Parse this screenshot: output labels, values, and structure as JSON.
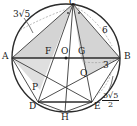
{
  "figure": {
    "type": "circle-geometry-diagram",
    "canvas": {
      "width": 137,
      "height": 126
    },
    "colors": {
      "stroke": "#2b2b2b",
      "thin_stroke": "#555555",
      "fill_gray": "#c9c9c9",
      "dashed": "#9a9a9a",
      "text": "#1a1a1a",
      "background": "#ffffff"
    },
    "circle": {
      "cx": 66,
      "cy": 58,
      "r": 54
    },
    "center_point": {
      "label": "O",
      "x": 66,
      "y": 58
    },
    "points": [
      {
        "name": "A",
        "x": 12,
        "y": 58,
        "label": "A",
        "label_x": 2,
        "label_y": 53
      },
      {
        "name": "B",
        "x": 120,
        "y": 58,
        "label": "B",
        "label_x": 124,
        "label_y": 53
      },
      {
        "name": "C",
        "x": 73,
        "y": 4,
        "label": "C",
        "label_x": 69,
        "label_y": -4
      },
      {
        "name": "D",
        "x": 38,
        "y": 102,
        "label": "D",
        "label_x": 30,
        "label_y": 103
      },
      {
        "name": "E",
        "x": 92,
        "y": 102,
        "label": "E",
        "label_x": 95,
        "label_y": 103
      },
      {
        "name": "F",
        "x": 52,
        "y": 58,
        "label": "F",
        "label_x": 46,
        "label_y": 48
      },
      {
        "name": "G",
        "x": 81,
        "y": 58,
        "label": "G",
        "label_x": 79,
        "label_y": 48
      },
      {
        "name": "H",
        "x": 65,
        "y": 112,
        "label": "H",
        "label_x": 61,
        "label_y": 113
      },
      {
        "name": "O",
        "x": 66,
        "y": 58,
        "label": "O",
        "label_x": 62,
        "label_y": 48
      },
      {
        "name": "P",
        "x": 40,
        "y": 90,
        "label": "P",
        "label_x": 32,
        "label_y": 84
      },
      {
        "name": "Q",
        "x": 88,
        "y": 76,
        "label": "Q",
        "label_x": 81,
        "label_y": 70
      }
    ],
    "measurements": [
      {
        "id": "ac-length",
        "text": "3√5",
        "parts": {
          "coef": "3",
          "radicand": "5"
        },
        "x": 14,
        "y": 11,
        "kind": "radical"
      },
      {
        "id": "cb-length",
        "text": "6",
        "parts": {
          "coef": "6"
        },
        "x": 103,
        "y": 28,
        "kind": "plain"
      },
      {
        "id": "gb-length",
        "text": "3",
        "parts": {
          "coef": "3"
        },
        "x": 104,
        "y": 63,
        "kind": "plain"
      },
      {
        "id": "be-length",
        "text": "3√5/2",
        "parts": {
          "num_coef": "3",
          "num_rad": "5",
          "den": "2"
        },
        "x": 104,
        "y": 94,
        "kind": "fraction-radical"
      }
    ],
    "angle_marks": [
      {
        "id": "angle-mark-left",
        "x": 68,
        "y": 12
      },
      {
        "id": "angle-mark-right",
        "x": 79,
        "y": 12
      }
    ],
    "shaded_regions": [
      {
        "id": "triangle-a-c-f",
        "vertices": [
          "A",
          "C",
          "F"
        ]
      },
      {
        "id": "triangle-c-g-b",
        "vertices": [
          "C",
          "G",
          "B"
        ]
      },
      {
        "id": "triangle-g-q-b",
        "vertices": [
          "G",
          "Q",
          "B"
        ]
      },
      {
        "id": "triangle-a-f-p",
        "vertices": [
          "A",
          "F",
          "P"
        ]
      }
    ],
    "segments": [
      {
        "id": "chord-ab",
        "from": "A",
        "to": "B",
        "style": "solid-thick"
      },
      {
        "id": "chord-de",
        "from": "D",
        "to": "E",
        "style": "solid-thick"
      },
      {
        "id": "chord-ac",
        "from": "A",
        "to": "C",
        "style": "solid"
      },
      {
        "id": "chord-cb",
        "from": "C",
        "to": "B",
        "style": "solid"
      },
      {
        "id": "chord-ch",
        "from": "C",
        "to": "H",
        "style": "solid"
      },
      {
        "id": "chord-cd",
        "from": "C",
        "to": "D",
        "style": "solid"
      },
      {
        "id": "chord-ce",
        "from": "C",
        "to": "E",
        "style": "solid"
      },
      {
        "id": "chord-ad",
        "from": "A",
        "to": "D",
        "style": "solid"
      },
      {
        "id": "chord-ae",
        "from": "A",
        "to": "E",
        "style": "solid"
      },
      {
        "id": "chord-bd",
        "from": "B",
        "to": "D",
        "style": "solid"
      },
      {
        "id": "chord-be",
        "from": "B",
        "to": "E",
        "style": "solid"
      },
      {
        "id": "chord-dh",
        "from": "D",
        "to": "H",
        "style": "solid"
      },
      {
        "id": "chord-he",
        "from": "H",
        "to": "E",
        "style": "solid"
      }
    ],
    "leader_arcs": [
      {
        "id": "leader-3sqrt5",
        "note": "curved leader from 3√5 label to chord AC"
      },
      {
        "id": "leader-6",
        "note": "dashed arc near chord CB"
      },
      {
        "id": "leader-3",
        "note": "dashed arc near segment GB"
      },
      {
        "id": "leader-3sqrt5-2",
        "note": "curved leader to chord BE"
      }
    ]
  }
}
